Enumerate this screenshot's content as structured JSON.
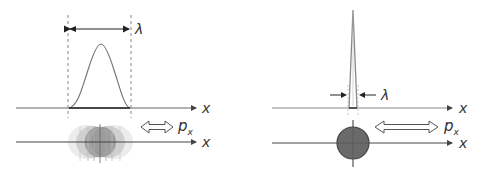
{
  "left_panel": {
    "wavelength_label": "λ",
    "axis_top_label": "x",
    "axis_bottom_label": "x",
    "momentum_label": "p",
    "momentum_subscript": "x",
    "description": "Wide wave packet: well-defined momentum, spread in position"
  },
  "right_panel": {
    "wavelength_label": "λ",
    "axis_top_label": "x",
    "axis_bottom_label": "x",
    "momentum_label": "p",
    "momentum_subscript": "x",
    "description": "Narrow spike: well-defined position, spread in momentum"
  },
  "colors": {
    "axis": "#555555",
    "curve": "#777777",
    "dashed": "#888888",
    "particle_fill": "#6a6a6a",
    "particle_stroke": "#333333",
    "blur_fill": "#9a9a9a"
  }
}
